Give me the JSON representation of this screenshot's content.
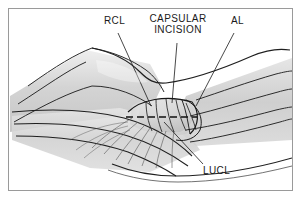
{
  "figure": {
    "kind": "medical-illustration",
    "border_color": "#9a9a9a",
    "background_color": "#ffffff",
    "ink_color": "#1a1a1a",
    "shading_color": "#d6d6d6"
  },
  "labels": [
    {
      "id": "rcl",
      "text": "RCL",
      "x": 104,
      "y": 20,
      "lines": 1
    },
    {
      "id": "capsular",
      "text": "CAPSULAR",
      "x": 149,
      "y": 18,
      "lines": 1
    },
    {
      "id": "incision",
      "text": "INCISION",
      "x": 156,
      "y": 29,
      "lines": 1
    },
    {
      "id": "al",
      "text": "AL",
      "x": 231,
      "y": 20,
      "lines": 1
    },
    {
      "id": "lucl",
      "text": "LUCL",
      "x": 205,
      "y": 170,
      "lines": 1
    }
  ],
  "leaders": [
    {
      "id": "rcl-leader",
      "from": [
        118,
        34
      ],
      "to": [
        151,
        106
      ]
    },
    {
      "id": "capsular-leader",
      "from": [
        176,
        43
      ],
      "to": [
        172,
        103
      ]
    },
    {
      "id": "al-leader",
      "from": [
        234,
        34
      ],
      "to": [
        196,
        105
      ]
    },
    {
      "id": "lucl-leader",
      "from": [
        203,
        166
      ],
      "to": [
        164,
        122
      ]
    }
  ],
  "annotations": {
    "incision_style": "dashed",
    "incision_from": [
      128,
      117
    ],
    "incision_to": [
      196,
      117
    ]
  }
}
